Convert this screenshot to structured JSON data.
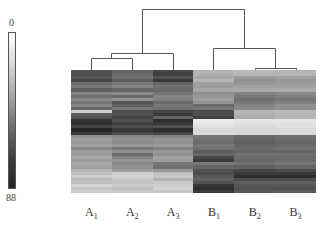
{
  "chart_data": {
    "type": "heatmap",
    "title": "",
    "colorbar": {
      "min_label": "0",
      "max_label": "88",
      "min_color": "#ffffff",
      "max_color": "#262626"
    },
    "columns": [
      {
        "base": "A",
        "sub": "1"
      },
      {
        "base": "A",
        "sub": "2"
      },
      {
        "base": "A",
        "sub": "3"
      },
      {
        "base": "B",
        "sub": "1"
      },
      {
        "base": "B",
        "sub": "2"
      },
      {
        "base": "B",
        "sub": "3"
      }
    ],
    "dendrogram": {
      "structure": "((((A1,A2),A3),(B1,(B2,B3))))",
      "clusters": [
        "A1+A2",
        "A1A2+A3",
        "B2+B3",
        "B1+B2B3",
        "A-group+B-group"
      ]
    },
    "row_count": 40,
    "values": [
      [
        70,
        62,
        75,
        30,
        28,
        30
      ],
      [
        72,
        60,
        78,
        32,
        30,
        30
      ],
      [
        68,
        58,
        70,
        35,
        40,
        38
      ],
      [
        75,
        65,
        80,
        30,
        45,
        42
      ],
      [
        60,
        55,
        62,
        38,
        42,
        40
      ],
      [
        55,
        50,
        58,
        40,
        38,
        38
      ],
      [
        65,
        62,
        60,
        36,
        35,
        35
      ],
      [
        50,
        48,
        55,
        45,
        50,
        48
      ],
      [
        58,
        60,
        50,
        42,
        55,
        52
      ],
      [
        48,
        45,
        52,
        40,
        58,
        55
      ],
      [
        55,
        70,
        60,
        44,
        55,
        52
      ],
      [
        50,
        65,
        55,
        60,
        50,
        45
      ],
      [
        62,
        55,
        58,
        55,
        48,
        45
      ],
      [
        20,
        72,
        75,
        72,
        30,
        28
      ],
      [
        65,
        70,
        80,
        72,
        32,
        30
      ],
      [
        70,
        75,
        62,
        78,
        34,
        30
      ],
      [
        82,
        70,
        85,
        8,
        10,
        10
      ],
      [
        85,
        78,
        80,
        10,
        12,
        12
      ],
      [
        75,
        72,
        70,
        12,
        15,
        12
      ],
      [
        88,
        80,
        85,
        15,
        15,
        15
      ],
      [
        80,
        72,
        75,
        14,
        15,
        15
      ],
      [
        45,
        48,
        50,
        55,
        60,
        58
      ],
      [
        40,
        45,
        42,
        58,
        62,
        60
      ],
      [
        42,
        48,
        45,
        60,
        65,
        62
      ],
      [
        38,
        42,
        40,
        55,
        62,
        60
      ],
      [
        48,
        55,
        50,
        58,
        60,
        58
      ],
      [
        40,
        45,
        42,
        65,
        62,
        62
      ],
      [
        42,
        60,
        45,
        62,
        58,
        58
      ],
      [
        35,
        50,
        38,
        75,
        60,
        60
      ],
      [
        40,
        45,
        40,
        80,
        62,
        60
      ],
      [
        35,
        48,
        55,
        55,
        58,
        55
      ],
      [
        38,
        45,
        58,
        62,
        65,
        62
      ],
      [
        30,
        40,
        42,
        70,
        75,
        72
      ],
      [
        25,
        20,
        25,
        72,
        80,
        80
      ],
      [
        20,
        18,
        22,
        68,
        85,
        85
      ],
      [
        28,
        22,
        30,
        65,
        72,
        72
      ],
      [
        25,
        25,
        22,
        70,
        65,
        65
      ],
      [
        18,
        22,
        20,
        82,
        68,
        68
      ],
      [
        22,
        25,
        18,
        85,
        70,
        70
      ],
      [
        20,
        22,
        22,
        80,
        68,
        66
      ]
    ]
  }
}
